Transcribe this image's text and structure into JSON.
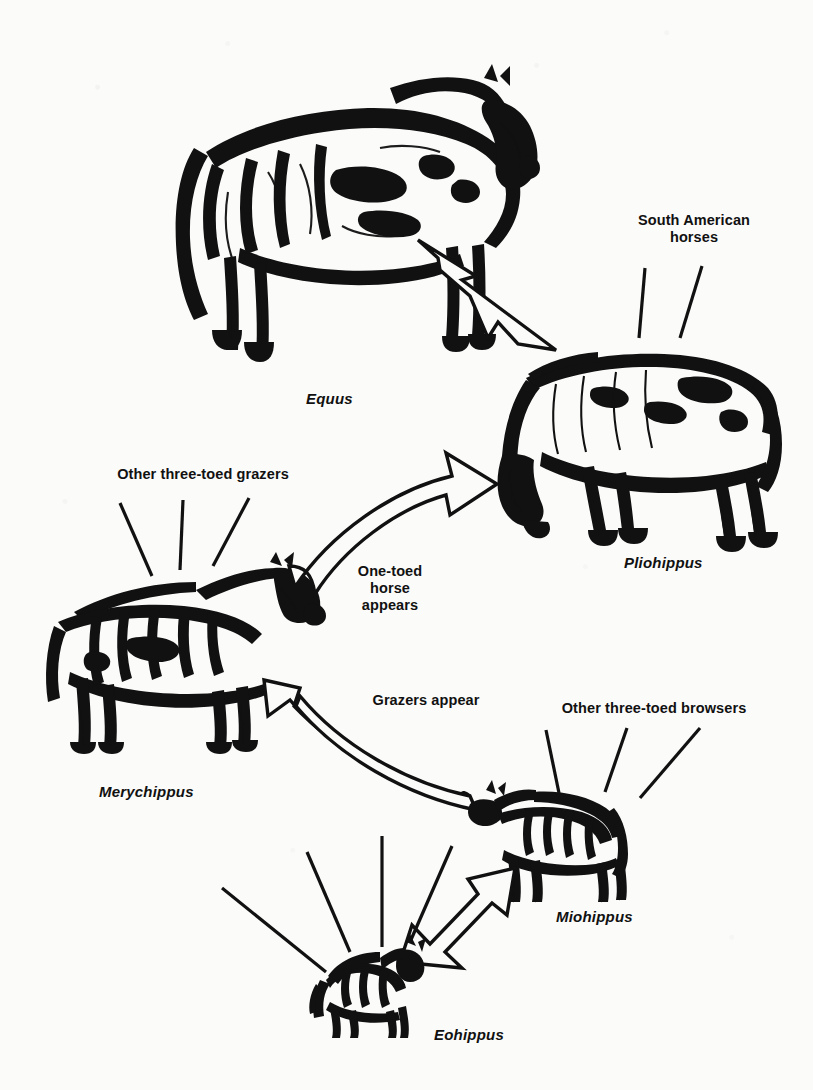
{
  "figure": {
    "type": "diagram",
    "background_color": "#fbfbfa",
    "ink_color": "#111111"
  },
  "genus_labels": [
    {
      "name": "equus",
      "text": "Equus"
    },
    {
      "name": "pliohippus",
      "text": "Pliohippus"
    },
    {
      "name": "merychippus",
      "text": "Merychippus"
    },
    {
      "name": "miohippus",
      "text": "Miohippus"
    },
    {
      "name": "eohippus",
      "text": "Eohippus"
    }
  ],
  "callouts": [
    {
      "name": "south-american-horses",
      "text": "South American\nhorses",
      "ticks": 2
    },
    {
      "name": "other-three-toed-grazers",
      "text": "Other three-toed grazers",
      "ticks": 3
    },
    {
      "name": "other-three-toed-browsers",
      "text": "Other three-toed browsers",
      "ticks": 3
    },
    {
      "name": "eohippus-radiation",
      "text": "",
      "ticks": 4
    }
  ],
  "arrow_annotations": [
    {
      "name": "one-toed-horse-appears",
      "text": "One-toed\nhorse\nappears",
      "from": "Merychippus",
      "to": "Pliohippus"
    },
    {
      "name": "grazers-appear",
      "text": "Grazers appear",
      "from": "Miohippus",
      "to": "Merychippus"
    },
    {
      "name": "eohippus-to-miohippus",
      "text": "",
      "from": "Eohippus",
      "to": "Miohippus"
    },
    {
      "name": "pliohippus-to-equus",
      "text": "",
      "from": "Pliohippus",
      "to": "Equus"
    }
  ]
}
